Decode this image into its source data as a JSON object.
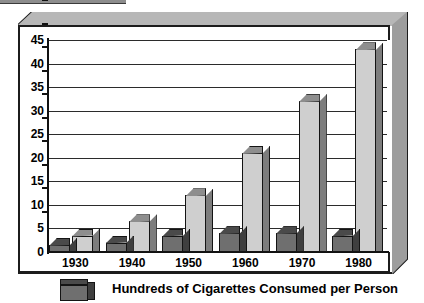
{
  "chart_data": {
    "type": "bar",
    "title": "",
    "subtitle": "",
    "xlabel": "",
    "ylabel": "",
    "categories": [
      "1930",
      "1940",
      "1950",
      "1960",
      "1970",
      "1980"
    ],
    "series": [
      {
        "name": "Hundreds of Cigarettes Consumed per Person",
        "style": "dark",
        "values": [
          1.5,
          2,
          3.5,
          4,
          4,
          3.5
        ]
      },
      {
        "name": "light-series",
        "style": "light",
        "values": [
          3.5,
          6.5,
          12,
          21,
          32,
          43
        ]
      }
    ],
    "ylim": [
      0,
      45
    ],
    "ytick_labels": [
      "0",
      "5",
      "10",
      "15",
      "20",
      "25",
      "30",
      "35",
      "40",
      "45"
    ],
    "ytick_values": [
      0,
      5,
      10,
      15,
      20,
      25,
      30,
      35,
      40,
      45
    ],
    "grid": true,
    "legend_position": "bottom",
    "legend_entries": [
      "Hundreds of Cigarettes Consumed per Person"
    ],
    "annotations": [],
    "colors": {
      "dark_bar_face": "#6f6f6f",
      "dark_bar_top": "#4a4a4a",
      "dark_bar_side": "#3f3f3f",
      "light_bar_face": "#cfcfcf",
      "light_bar_top": "#8e8e8e",
      "light_bar_side": "#7d7d7d",
      "axis": "#111111",
      "grid": "#2b2b2b",
      "plaque_top": "#b7b7b7",
      "plaque_side": "#9d9d9d",
      "background": "#ffffff"
    }
  },
  "legend": {
    "label": "Hundreds of Cigarettes Consumed per Person",
    "swatch_icon": "dark-cube-icon"
  },
  "axes": {
    "y_ticks": [
      "45",
      "40",
      "35",
      "30",
      "25",
      "20",
      "15",
      "10",
      "5",
      "0"
    ],
    "x_ticks": [
      "1930",
      "1940",
      "1950",
      "1960",
      "1970",
      "1980"
    ]
  }
}
